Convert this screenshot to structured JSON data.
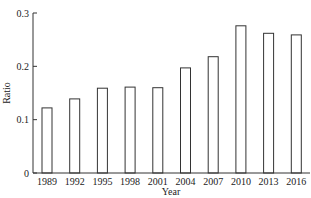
{
  "chart_data": {
    "type": "bar",
    "title": "",
    "xlabel": "Year",
    "ylabel": "Ratio",
    "ylim": [
      0,
      0.3
    ],
    "yticks": [
      0,
      0.1,
      0.2,
      0.3
    ],
    "ytick_labels": [
      "0",
      "0.1",
      "0.2",
      "0.3"
    ],
    "grid": false,
    "legend": null,
    "categories": [
      "1989",
      "1992",
      "1995",
      "1998",
      "2001",
      "2004",
      "2007",
      "2010",
      "2013",
      "2016"
    ],
    "values": [
      0.122,
      0.139,
      0.159,
      0.161,
      0.16,
      0.197,
      0.218,
      0.276,
      0.262,
      0.259
    ],
    "bar_fill": "#ffffff",
    "bar_stroke": "#333333"
  }
}
